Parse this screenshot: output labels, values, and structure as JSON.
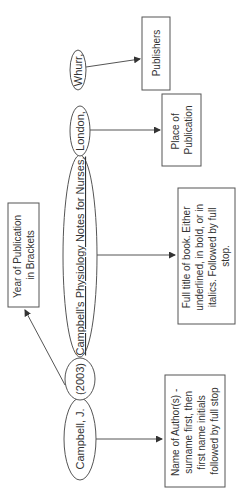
{
  "diagram": {
    "orientation": "rotated -90deg",
    "colors": {
      "stroke": "#555555",
      "text": "#333333",
      "background": "#ffffff"
    },
    "citation_parts": [
      {
        "id": "author",
        "text": "Campbell, J."
      },
      {
        "id": "year",
        "text": "(2003)"
      },
      {
        "id": "title",
        "text": "Campbell's Physiology Notes for Nurses.",
        "underlined": true
      },
      {
        "id": "place",
        "text": "London,"
      },
      {
        "id": "publisher",
        "text": "Whurr,"
      }
    ],
    "annotations": [
      {
        "id": "author_note",
        "lines": [
          "Name of Author(s) -",
          "surname first, then",
          "first name initials",
          "followed by full stop"
        ]
      },
      {
        "id": "year_note",
        "lines": [
          "Year of Publication",
          "in Brackets"
        ]
      },
      {
        "id": "title_note",
        "lines": [
          "Full title of book. Either",
          "underlined, in bold, or in",
          "italics. Followed by full",
          "stop."
        ]
      },
      {
        "id": "place_note",
        "lines": [
          "Place of",
          "Publication"
        ]
      },
      {
        "id": "publisher_note",
        "lines": [
          "Publishers"
        ]
      }
    ]
  }
}
